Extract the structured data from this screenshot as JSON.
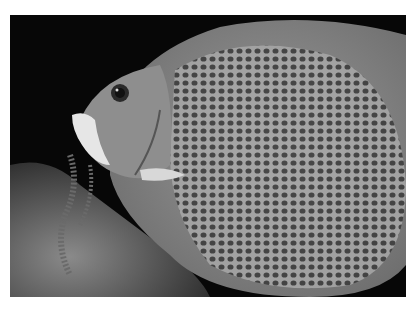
{
  "image": {
    "subject": "grey angelfish close-up underwater",
    "background_color": "#070707",
    "fish_body_color": "#8c8c8c",
    "fish_face_color": "#9a9a9a",
    "mouth_color": "#e8e8e8",
    "coral_color": "#5a5a5a",
    "page_background": "#ffffff"
  }
}
